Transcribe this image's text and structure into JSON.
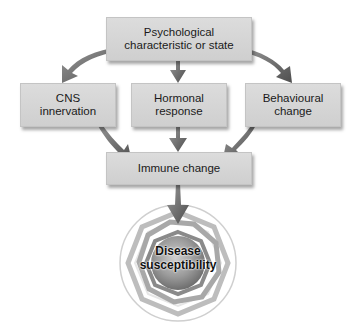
{
  "diagram": {
    "nodes": {
      "top": {
        "line1": "Psychological",
        "line2": "characteristic or state"
      },
      "cns": {
        "line1": "CNS",
        "line2": "innervation"
      },
      "hormonal": {
        "line1": "Hormonal",
        "line2": "response"
      },
      "behavioural": {
        "line1": "Behavioural",
        "line2": "change"
      },
      "immune": {
        "line1": "Immune change"
      },
      "disease": {
        "line1": "Disease",
        "line2": "susceptibility"
      }
    },
    "edges": [
      {
        "from": "top",
        "to": "cns"
      },
      {
        "from": "top",
        "to": "hormonal"
      },
      {
        "from": "top",
        "to": "behavioural"
      },
      {
        "from": "cns",
        "to": "immune"
      },
      {
        "from": "hormonal",
        "to": "immune"
      },
      {
        "from": "behavioural",
        "to": "immune"
      },
      {
        "from": "immune",
        "to": "disease"
      }
    ],
    "colors": {
      "box_fill": "#d4d4d4",
      "arrow": "#6a6a6a",
      "target_core": "#8c8c8c"
    }
  }
}
